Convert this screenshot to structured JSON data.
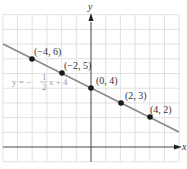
{
  "chart_data": {
    "type": "line",
    "title": "",
    "xlabel": "x",
    "ylabel": "y",
    "xlim": [
      -6,
      6
    ],
    "ylim": [
      -1,
      9
    ],
    "grid": true,
    "series": [
      {
        "name": "y = -1/2 x + 4",
        "equation": "y = -1/2 x + 4",
        "slope": -0.5,
        "intercept": 4,
        "color": "#888888",
        "points": [
          {
            "x": -4,
            "y": 6,
            "label": "(-4, 6)"
          },
          {
            "x": -2,
            "y": 5,
            "label": "(-2, 5)"
          },
          {
            "x": 0,
            "y": 4,
            "label": "(0, 4)"
          },
          {
            "x": 2,
            "y": 3,
            "label": "(2, 3)"
          },
          {
            "x": 4,
            "y": 2,
            "label": "(4, 2)"
          }
        ]
      }
    ],
    "annotations": [
      {
        "text": "y = -1/2 x + 4",
        "position": "left of y-axis, below line"
      }
    ]
  },
  "labels": {
    "x_axis": "x",
    "y_axis": "y",
    "equation_lhs": "y = −",
    "equation_frac_num": "1",
    "equation_frac_den": "2",
    "equation_rhs": "x + 4",
    "p1": "(−4, 6)",
    "p2": "(−2, 5)",
    "p3": "(0, 4)",
    "p4": "(2, 3)",
    "p5": "(4, 2)"
  },
  "colors": {
    "grid": "#d9d9d9",
    "axis": "#555555",
    "line": "#8a8a8a",
    "point": "#1a1a1a",
    "equation": "#9aa0a6"
  }
}
